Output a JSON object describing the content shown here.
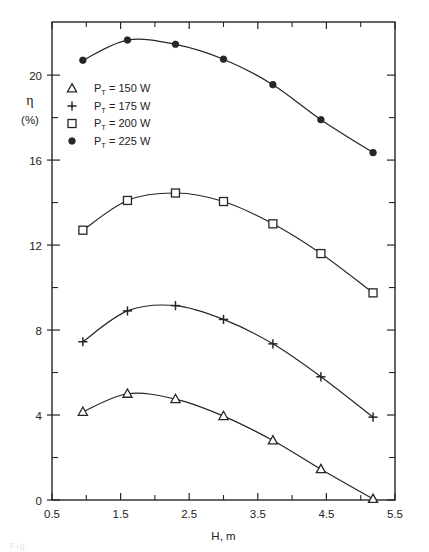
{
  "figure": {
    "background": "#ffffff",
    "ink_color": "#262626",
    "caption_fragment": "Fig."
  },
  "axes": {
    "x": {
      "label": "H, m",
      "min": 0.5,
      "max": 5.5,
      "major_ticks": [
        0.5,
        1.5,
        2.5,
        3.5,
        4.5,
        5.5
      ],
      "major_tick_labels": [
        "0.5",
        "1.5",
        "2.5",
        "3.5",
        "4.5",
        "5.5"
      ],
      "minor_ticks": [
        1.0,
        2.0,
        3.0,
        4.0,
        5.0
      ]
    },
    "y": {
      "label": "η",
      "unit_label": "(%)",
      "min": 0,
      "max": 22.5,
      "major_ticks": [
        0,
        4,
        8,
        12,
        16,
        20
      ],
      "major_tick_labels": [
        "0",
        "4",
        "8",
        "12",
        "16",
        "20"
      ],
      "minor_ticks": [
        2,
        6,
        10,
        14,
        18
      ]
    }
  },
  "legend": {
    "entries": [
      {
        "marker": "triangle",
        "symbol": "△",
        "variable": "P",
        "subscript": "T",
        "equals": "=",
        "value": "150",
        "unit": "W",
        "text": "Pₜ = 150 W"
      },
      {
        "marker": "plus",
        "symbol": "+",
        "variable": "P",
        "subscript": "T",
        "equals": "=",
        "value": "175",
        "unit": "W",
        "text": "Pₜ = 175 W"
      },
      {
        "marker": "square",
        "symbol": "□",
        "variable": "P",
        "subscript": "T",
        "equals": "=",
        "value": "200",
        "unit": "W",
        "text": "Pₜ = 200 W"
      },
      {
        "marker": "filled-circle",
        "symbol": "●",
        "variable": "P",
        "subscript": "T",
        "equals": "=",
        "value": "225",
        "unit": "W",
        "text": "Pₜ = 225 W"
      }
    ]
  },
  "chart_data": {
    "type": "line",
    "title": "",
    "xlabel": "H, m",
    "ylabel": "η (%)",
    "xlim": [
      0.5,
      5.5
    ],
    "ylim": [
      0,
      22.5
    ],
    "grid": false,
    "legend_position": "upper-left-inside",
    "series": [
      {
        "name": "P_T = 150 W",
        "marker": "triangle",
        "x": [
          0.95,
          1.6,
          2.3,
          3.0,
          3.72,
          4.42,
          5.18
        ],
        "y": [
          4.15,
          5.0,
          4.75,
          3.95,
          2.8,
          1.45,
          0.05
        ]
      },
      {
        "name": "P_T = 175 W",
        "marker": "plus",
        "x": [
          0.95,
          1.6,
          2.3,
          3.0,
          3.72,
          4.42,
          5.18
        ],
        "y": [
          7.45,
          8.9,
          9.15,
          8.5,
          7.35,
          5.8,
          3.9
        ]
      },
      {
        "name": "P_T = 200 W",
        "marker": "square",
        "x": [
          0.95,
          1.6,
          2.3,
          3.0,
          3.72,
          4.42,
          5.18
        ],
        "y": [
          12.7,
          14.1,
          14.45,
          14.05,
          13.0,
          11.6,
          9.75
        ]
      },
      {
        "name": "P_T = 225 W",
        "marker": "filled-circle",
        "x": [
          0.95,
          1.6,
          2.3,
          3.0,
          3.72,
          4.42,
          5.18
        ],
        "y": [
          20.7,
          21.65,
          21.45,
          20.75,
          19.55,
          17.9,
          16.35
        ]
      }
    ]
  }
}
